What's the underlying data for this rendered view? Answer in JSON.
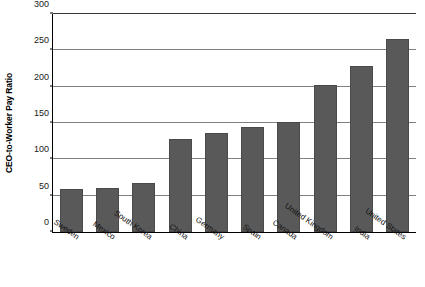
{
  "chart_data": {
    "type": "bar",
    "title": "",
    "subtitle": "",
    "xlabel": "",
    "ylabel": "CEO-to-Worker Pay Ratio",
    "ylim": [
      0,
      300
    ],
    "yticks": [
      0,
      50,
      100,
      150,
      200,
      250,
      300
    ],
    "ytick_labels": [
      "0",
      "50",
      "100",
      "150",
      "200",
      "250",
      "300"
    ],
    "grid": "horizontal",
    "legend": "none",
    "bar_color": "#595959",
    "categories": [
      "Sweden",
      "Mexico",
      "South Korea",
      "China",
      "Germany",
      "Spain",
      "Canada",
      "United Kingdom",
      "India",
      "United States"
    ],
    "values": [
      59,
      61,
      67,
      128,
      136,
      144,
      152,
      202,
      229,
      265
    ]
  }
}
